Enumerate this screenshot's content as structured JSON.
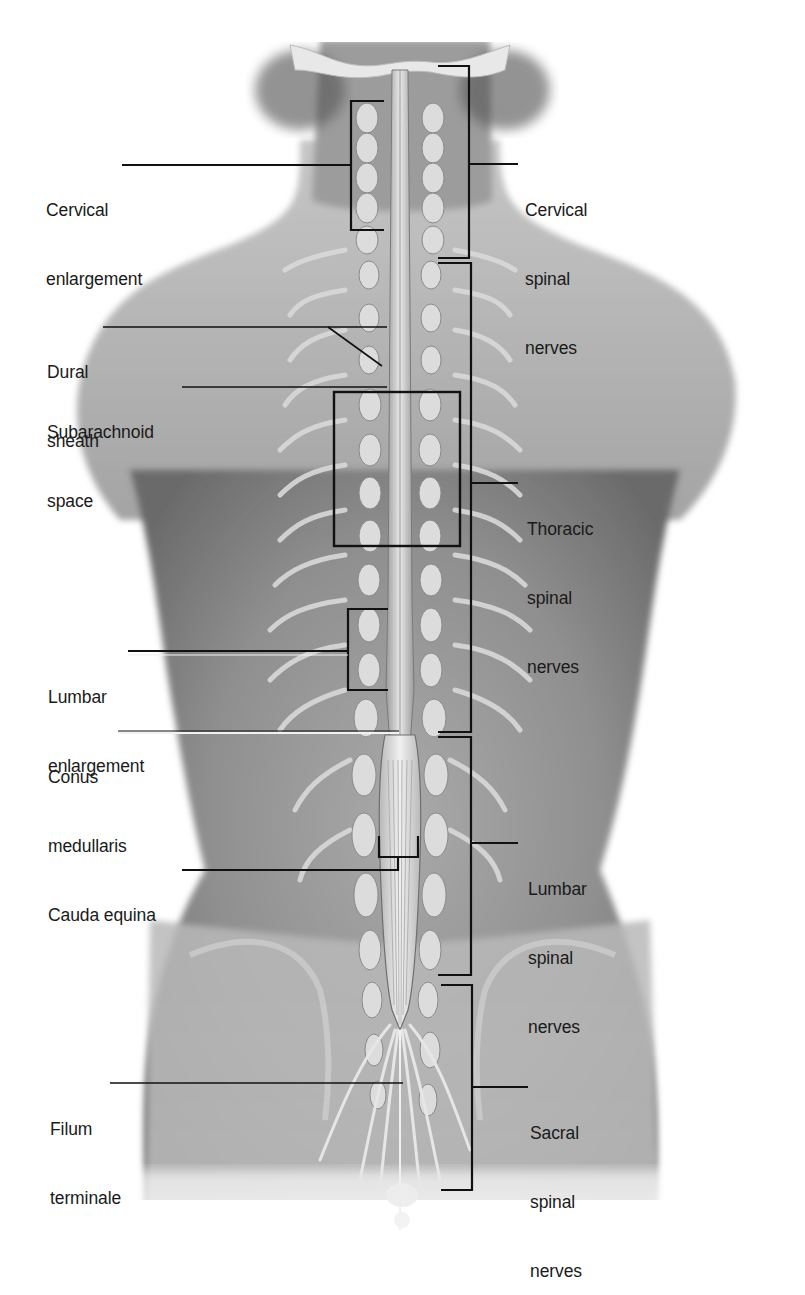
{
  "figure": {
    "colors": {
      "background": "#ffffff",
      "skin_light": "#c9c9c9",
      "skin_mid": "#a8a8a8",
      "skin_dark": "#6e6e6e",
      "bone": "#e4e4e4",
      "cord": "#d8d8d8",
      "leader_line": "#111111",
      "label_text": "#1a1a1a"
    }
  },
  "labels_left": [
    {
      "id": "cervical-enlargement",
      "lines": [
        "Cervical",
        "enlargement"
      ],
      "x": 46,
      "y": 153
    },
    {
      "id": "dural-sheath",
      "lines": [
        "Dural",
        "sheath"
      ],
      "x": 47,
      "y": 315
    },
    {
      "id": "subarachnoid-space",
      "lines": [
        "Subarachnoid",
        "space"
      ],
      "x": 47,
      "y": 373
    },
    {
      "id": "lumbar-enlargement",
      "lines": [
        "Lumbar",
        "enlargement"
      ],
      "x": 48,
      "y": 638
    },
    {
      "id": "conus-medullaris",
      "lines": [
        "Conus",
        "medullaris"
      ],
      "x": 48,
      "y": 721
    },
    {
      "id": "cauda-equina",
      "lines": [
        "Cauda equina"
      ],
      "x": 48,
      "y": 859
    },
    {
      "id": "filum-terminale",
      "lines": [
        "Filum",
        "terminale"
      ],
      "x": 50,
      "y": 1078
    }
  ],
  "labels_right": [
    {
      "id": "cervical-spinal-nerves",
      "lines": [
        "Cervical",
        "spinal",
        "nerves"
      ],
      "x": 528,
      "y": 153
    },
    {
      "id": "thoracic-spinal-nerves",
      "lines": [
        "Thoracic",
        "spinal",
        "nerves"
      ],
      "x": 528,
      "y": 470
    },
    {
      "id": "lumbar-spinal-nerves",
      "lines": [
        "Lumbar",
        "spinal",
        "nerves"
      ],
      "x": 528,
      "y": 830
    },
    {
      "id": "sacral-spinal-nerves",
      "lines": [
        "Sacral",
        "spinal",
        "nerves"
      ],
      "x": 528,
      "y": 1074
    }
  ],
  "brackets": {
    "cervical_enlargement": {
      "x": 351,
      "top": 100,
      "bottom": 230,
      "tip": 384
    },
    "lumbar_enlargement": {
      "x": 348,
      "top": 610,
      "bottom": 690,
      "tip": 385
    },
    "thoracic_box": {
      "x": 334,
      "y": 392,
      "w": 125,
      "h": 154
    },
    "cauda_equina": {
      "left": 379,
      "right": 418,
      "top": 836,
      "bottom": 857,
      "stem": 398
    },
    "cervical_nerves": {
      "x": 469,
      "top": 66,
      "bottom": 258,
      "tip": 438
    },
    "thoracic_nerves": {
      "x": 469,
      "top": 263,
      "bottom": 732,
      "tip": 438
    },
    "lumbar_nerves": {
      "x": 469,
      "top": 737,
      "bottom": 975,
      "tip": 438
    },
    "sacral_nerves": {
      "x": 472,
      "top": 985,
      "bottom": 1190,
      "tip": 441
    }
  }
}
